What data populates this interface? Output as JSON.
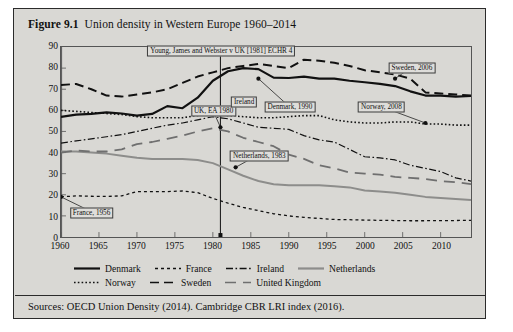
{
  "figure": {
    "label": "Figure 9.1",
    "title": "Union density in Western Europe 1960–2014",
    "sources": "Sources: OECD Union Density (2014). Cambridge CBR LRI index (2016)."
  },
  "chart_data": {
    "type": "line",
    "title": "Union density in Western Europe 1960–2014",
    "xlabel": "",
    "ylabel": "",
    "xlim": [
      1960,
      2014
    ],
    "ylim": [
      0,
      90
    ],
    "ytick_step": 10,
    "xtick_step": 5,
    "grid": false,
    "legend_position": "bottom",
    "yticks": [
      0,
      10,
      20,
      30,
      40,
      50,
      60,
      70,
      80,
      90
    ],
    "xticks": [
      1960,
      1965,
      1970,
      1975,
      1980,
      1985,
      1990,
      1995,
      2000,
      2005,
      2010
    ],
    "x": [
      1960,
      1962,
      1964,
      1966,
      1968,
      1970,
      1972,
      1974,
      1976,
      1978,
      1980,
      1982,
      1984,
      1986,
      1988,
      1990,
      1992,
      1994,
      1996,
      1998,
      2000,
      2002,
      2004,
      2006,
      2008,
      2010,
      2012,
      2014
    ],
    "series": [
      {
        "name": "Denmark",
        "style": "solid",
        "color": "#111111",
        "width": 2.2,
        "values": [
          56.9,
          58.0,
          58.3,
          59.0,
          58.5,
          57.5,
          58.3,
          62.0,
          61.0,
          66.0,
          74.0,
          78.5,
          80.0,
          79.5,
          75.5,
          75.3,
          76.0,
          75.0,
          75.0,
          74.0,
          73.3,
          72.5,
          71.5,
          69.0,
          67.0,
          67.0,
          66.5,
          66.8
        ]
      },
      {
        "name": "France",
        "style": "dotted",
        "color": "#111111",
        "width": 1.3,
        "values": [
          19.0,
          19.5,
          19.3,
          19.2,
          19.5,
          21.5,
          21.5,
          21.5,
          21.8,
          21.0,
          18.3,
          16.0,
          14.0,
          12.5,
          11.0,
          10.0,
          9.3,
          8.8,
          8.3,
          8.2,
          8.0,
          7.9,
          7.8,
          7.7,
          7.7,
          7.8,
          7.8,
          7.9
        ]
      },
      {
        "name": "Ireland",
        "style": "dashdot",
        "color": "#111111",
        "width": 1.2,
        "values": [
          44.5,
          45.5,
          46.5,
          47.5,
          48.5,
          50.0,
          51.5,
          53.0,
          54.0,
          55.5,
          57.0,
          56.0,
          54.0,
          52.0,
          51.5,
          51.0,
          48.0,
          46.0,
          45.0,
          41.5,
          38.0,
          37.5,
          36.5,
          34.0,
          32.5,
          31.0,
          28.0,
          26.5
        ]
      },
      {
        "name": "Netherlands",
        "style": "solid",
        "color": "#8d8d8b",
        "width": 2.0,
        "values": [
          40.5,
          40.5,
          40.0,
          39.5,
          38.5,
          37.5,
          37.0,
          37.0,
          37.0,
          36.5,
          35.0,
          32.0,
          29.0,
          26.5,
          25.0,
          24.5,
          24.5,
          24.5,
          24.0,
          23.5,
          22.0,
          21.5,
          21.0,
          20.0,
          19.0,
          18.5,
          18.0,
          17.5
        ]
      },
      {
        "name": "Norway",
        "style": "densedot",
        "color": "#111111",
        "width": 1.6,
        "values": [
          60.0,
          59.5,
          59.0,
          58.5,
          58.0,
          57.0,
          56.5,
          56.5,
          56.5,
          57.5,
          58.3,
          57.5,
          57.0,
          56.5,
          56.5,
          57.0,
          57.5,
          57.5,
          55.5,
          54.5,
          54.0,
          54.0,
          54.5,
          54.5,
          53.5,
          53.5,
          53.0,
          53.0
        ]
      },
      {
        "name": "Sweden",
        "style": "dashed",
        "color": "#111111",
        "width": 2.0,
        "values": [
          72.0,
          72.5,
          70.0,
          67.0,
          66.5,
          67.5,
          68.5,
          70.0,
          73.0,
          76.0,
          78.0,
          80.0,
          81.0,
          82.0,
          81.0,
          80.0,
          84.0,
          83.5,
          82.5,
          81.0,
          79.0,
          78.0,
          77.0,
          75.0,
          68.5,
          68.0,
          67.5,
          67.0
        ]
      },
      {
        "name": "United Kingdom",
        "style": "longdash",
        "color": "#6f6f6f",
        "width": 1.8,
        "values": [
          40.0,
          41.0,
          40.5,
          40.5,
          41.5,
          44.0,
          45.0,
          46.5,
          48.0,
          50.0,
          51.5,
          50.0,
          47.0,
          45.0,
          43.0,
          39.0,
          37.0,
          34.0,
          32.5,
          30.5,
          30.0,
          29.5,
          28.5,
          28.0,
          27.5,
          26.5,
          26.0,
          25.0
        ]
      }
    ],
    "vertical_marker": {
      "x": 1981,
      "label": "Young, James and Webster v UK [1981] ECHR 4"
    },
    "annotations": [
      {
        "text": "Young, James and Webster v UK [1981] ECHR 4",
        "x": 1981,
        "y": 88
      },
      {
        "text": "UK, EA 1980",
        "x": 1980,
        "y": 60,
        "point": [
          1981,
          52
        ]
      },
      {
        "text": "Ireland",
        "x": 1984,
        "y": 64,
        "point": [
          1981,
          58
        ]
      },
      {
        "text": "Denmark, 1990",
        "x": 1990,
        "y": 62,
        "point": [
          1986,
          75
        ]
      },
      {
        "text": "Sweden, 2006",
        "x": 2006,
        "y": 80,
        "point": [
          2004,
          75
        ]
      },
      {
        "text": "Norway, 2008",
        "x": 2002,
        "y": 62,
        "point": [
          2008,
          54
        ]
      },
      {
        "text": "Netherlands, 1983",
        "x": 1986,
        "y": 39,
        "point": [
          1983,
          33
        ]
      },
      {
        "text": "France, 1956",
        "x": 1964,
        "y": 12,
        "point": [
          1960,
          19
        ]
      }
    ]
  },
  "legend": {
    "rows": [
      [
        {
          "label": "Denmark",
          "style": "solid",
          "color": "#111111"
        },
        {
          "label": "France",
          "style": "dotted",
          "color": "#111111"
        },
        {
          "label": "Ireland",
          "style": "dashdot",
          "color": "#111111"
        },
        {
          "label": "Netherlands",
          "style": "solid",
          "color": "#8d8d8b"
        }
      ],
      [
        {
          "label": "Norway",
          "style": "densedot",
          "color": "#111111"
        },
        {
          "label": "Sweden",
          "style": "dashed",
          "color": "#111111"
        },
        {
          "label": "United Kingdom",
          "style": "longdash",
          "color": "#6f6f6f"
        }
      ]
    ]
  }
}
